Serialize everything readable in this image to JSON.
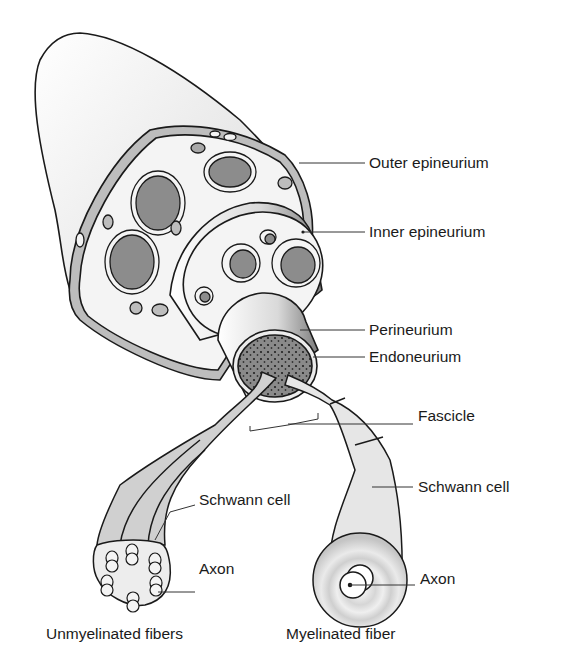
{
  "diagram": {
    "labels": {
      "outer_epineurium": "Outer epineurium",
      "inner_epineurium": "Inner epineurium",
      "perineurium": "Perineurium",
      "endoneurium": "Endoneurium",
      "fascicle": "Fascicle",
      "schwann_cell_right": "Schwann cell",
      "schwann_cell_left": "Schwann cell",
      "axon_left": "Axon",
      "axon_right": "Axon"
    },
    "captions": {
      "unmyelinated": "Unmyelinated fibers",
      "myelinated": "Myelinated fiber"
    },
    "colors": {
      "outline": "#1a1a1a",
      "fascicle_fill": "#8c8c8c",
      "sheath_light": "#f2f2f2",
      "tissue_mid": "#bdbdbd",
      "myelin": "#c8c8c8"
    }
  }
}
